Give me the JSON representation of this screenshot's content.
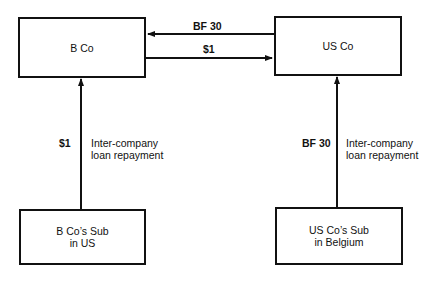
{
  "diagram": {
    "nodes": {
      "b_co": {
        "label": "B Co"
      },
      "us_co": {
        "label": "US Co"
      },
      "b_co_sub": {
        "label": "B Co’s Sub\nin US"
      },
      "us_co_sub": {
        "label": "US Co’s Sub\nin Belgium"
      }
    },
    "edges": {
      "us_to_b": {
        "from": "US Co",
        "to": "B Co",
        "amount": "BF 30"
      },
      "b_to_us": {
        "from": "B Co",
        "to": "US Co",
        "amount": "$1"
      },
      "bsub_to_b": {
        "from": "B Co’s Sub in US",
        "to": "B Co",
        "amount": "$1",
        "description": "Inter-company\nloan repayment"
      },
      "ussub_to_us": {
        "from": "US Co’s Sub in Belgium",
        "to": "US Co",
        "amount": "BF 30",
        "description": "Inter-company\nloan repayment"
      }
    },
    "colors": {
      "stroke": "#111111",
      "background": "#ffffff"
    }
  }
}
